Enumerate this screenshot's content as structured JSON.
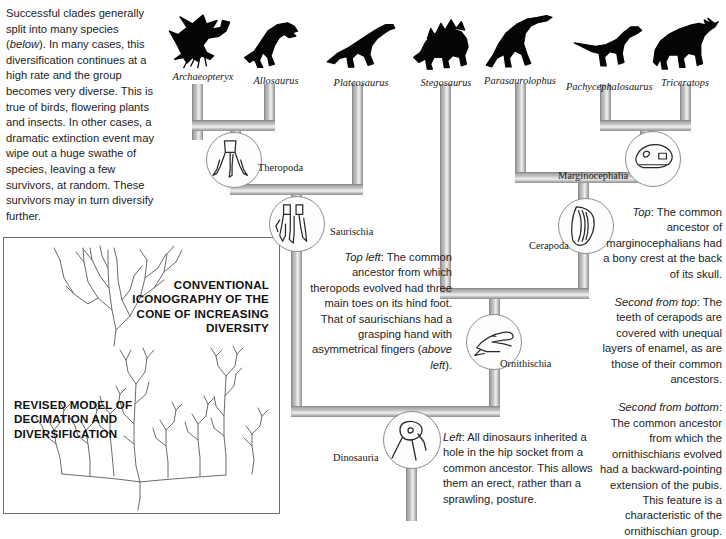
{
  "intro": {
    "paragraph_parts": [
      {
        "text": "Successful clades generally split into many species (",
        "style": "normal"
      },
      {
        "text": "below",
        "style": "italic"
      },
      {
        "text": "). In many cases, this diversification continues at a high rate and the group becomes very diverse. This is true of birds, flowering plants and insects. In other cases, a dramatic extinction event may wipe out a huge swathe of species, leaving a few survivors, at random. These survivors may in turn diversify further.",
        "style": "normal"
      }
    ]
  },
  "model_box": {
    "conventional_caption": "CONVENTIONAL ICONOGRAPHY OF THE CONE OF INCREASING DIVERSITY",
    "revised_caption": "REVISED MODEL OF DECIMATION AND DIVERSIFICATION"
  },
  "taxa": [
    {
      "name": "Archaeopteryx",
      "icon": "archaeopteryx-silhouette",
      "x": 167,
      "y": 8,
      "w": 72
    },
    {
      "name": "Allosaurus",
      "icon": "allosaurus-silhouette",
      "x": 243,
      "y": 12,
      "w": 66
    },
    {
      "name": "Plateosaurus",
      "icon": "plateosaurus-silhouette",
      "x": 322,
      "y": 14,
      "w": 78
    },
    {
      "name": "Stegosaurus",
      "icon": "stegosaurus-silhouette",
      "x": 412,
      "y": 14,
      "w": 68
    },
    {
      "name": "Parasaurolophus",
      "icon": "parasaurolophus-silhouette",
      "x": 478,
      "y": 12,
      "w": 84
    },
    {
      "name": "Pachycephalosaurus",
      "icon": "pachycephalosaurus-silhouette",
      "x": 566,
      "y": 18,
      "w": 84
    },
    {
      "name": "Triceratops",
      "icon": "triceratops-silhouette",
      "x": 650,
      "y": 14,
      "w": 70
    }
  ],
  "clades": [
    {
      "name": "Theropoda",
      "label_x": 258,
      "label_y": 162,
      "node_x": 206,
      "node_y": 132,
      "node_d": 56,
      "icon": "theropod-hind-foot-icon"
    },
    {
      "name": "Saurischia",
      "label_x": 330,
      "label_y": 226,
      "node_x": 269,
      "node_y": 196,
      "node_d": 56,
      "icon": "saurischian-grasping-hand-icon"
    },
    {
      "name": "Marginocephalia",
      "label_x": 558,
      "label_y": 170,
      "node_x": 625,
      "node_y": 131,
      "node_d": 56,
      "icon": "pachycephalosaur-skull-icon"
    },
    {
      "name": "Cerapoda",
      "label_x": 529,
      "label_y": 240,
      "node_x": 558,
      "node_y": 198,
      "node_d": 56,
      "icon": "cerapod-tooth-enamel-icon"
    },
    {
      "name": "Ornithischia",
      "label_x": 500,
      "label_y": 358,
      "node_x": 466,
      "node_y": 314,
      "node_d": 56,
      "icon": "ornithischian-pubis-icon"
    },
    {
      "name": "Dinosauria",
      "label_x": 333,
      "label_y": 452,
      "node_x": 383,
      "node_y": 411,
      "node_d": 58,
      "icon": "hip-socket-icon"
    }
  ],
  "captions": {
    "top_left": {
      "lead": "Top left",
      "body": ": The common ancestor from which theropods evolved had three main toes on its hind foot. That of saurischians had a grasping hand with asymmetrical fingers (",
      "tail_italic": "above left",
      "tail": ")."
    },
    "left": {
      "lead": "Left",
      "body": ": All dinosaurs inherited a hole in the hip socket from a common ancestor. This allows them an erect, rather than a sprawling, posture."
    },
    "right": [
      {
        "lead": "Top",
        "body": ": The common ancestor of marginocephalians had a bony crest at the back of its skull."
      },
      {
        "lead": "Second from top",
        "body": ": The teeth of cerapods are covered with unequal layers of enamel, as are those of their common ancestors."
      },
      {
        "lead": "Second from bottom",
        "body": ": The common ancestor from which the ornithischians evolved had a backward-pointing extension of the pubis. This feature is a characteristic of the ornithischian group."
      }
    ]
  },
  "colors": {
    "branch_fill": "#9b9b9b",
    "branch_light": "#d6d6d6",
    "branch_highlight": "#efefef",
    "branch_dark": "#6f6f6f",
    "silhouette": "#050505",
    "text": "#232323",
    "box_border": "#6d6d6d",
    "sketch_line": "#6b6b6b"
  }
}
